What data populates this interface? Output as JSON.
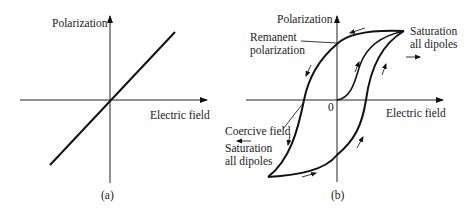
{
  "figure": {
    "panel_a": {
      "caption": "(a)",
      "y_axis_label": "Polarization",
      "x_axis_label": "Electric field",
      "description": "Linear relationship through origin"
    },
    "panel_b": {
      "caption": "(b)",
      "y_axis_label": "Polarization",
      "x_axis_label": "Electric field",
      "origin_label": "0",
      "annotations": {
        "remanent_line1": "Remanent",
        "remanent_line2": "polarization",
        "saturation_pos_line1": "Saturation",
        "saturation_pos_line2": "all dipoles",
        "coercive": "Coercive field",
        "saturation_neg_line1": "Saturation",
        "saturation_neg_line2": "all dipoles"
      },
      "description": "Ferroelectric hysteresis loop with initial polarization curve"
    }
  },
  "colors": {
    "stroke": "#111111",
    "background": "#ffffff"
  }
}
